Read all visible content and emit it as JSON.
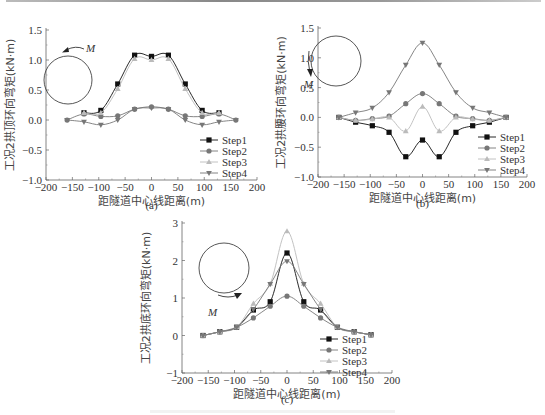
{
  "figure": {
    "panels": [
      "(a)",
      "(b)",
      "(c)"
    ]
  },
  "chart_data": [
    {
      "type": "line",
      "panel": "(a)",
      "title": "",
      "xlabel": "距隧道中心线距离(m)",
      "ylabel": "工况2拱顶环向弯矩(kN·m)",
      "xlim": [
        -200,
        200
      ],
      "ylim": [
        -1.0,
        1.5
      ],
      "xticks": [
        "-200",
        "-150",
        "-100",
        "-50",
        "0",
        "50",
        "100",
        "150",
        "200"
      ],
      "yticks": [
        "-1.0",
        "-0.5",
        "0.0",
        "0.5",
        "1.0",
        "1.5"
      ],
      "inset": {
        "shape": "circle",
        "moment_label": "M",
        "arrow_position": "top"
      },
      "legend_position": "lower right",
      "grid": false,
      "series": [
        {
          "name": "Step1",
          "marker": "square",
          "color": "#111111",
          "x": [
            -128,
            -96,
            -64,
            -32,
            0,
            32,
            64,
            96,
            128
          ],
          "values": [
            0.12,
            0.16,
            0.6,
            1.08,
            1.06,
            1.08,
            0.6,
            0.16,
            0.12
          ]
        },
        {
          "name": "Step2",
          "marker": "circle",
          "color": "#777777",
          "x": [
            -160,
            -128,
            -96,
            -64,
            -32,
            0,
            32,
            64,
            96,
            128,
            160
          ],
          "values": [
            0.0,
            0.1,
            0.06,
            0.07,
            0.18,
            0.22,
            0.18,
            0.07,
            0.06,
            0.1,
            0.0
          ]
        },
        {
          "name": "Step3",
          "marker": "triangle-up",
          "color": "#bbbbbb",
          "x": [
            -128,
            -96,
            -64,
            -32,
            0,
            32,
            64,
            96,
            128
          ],
          "values": [
            0.12,
            0.12,
            0.52,
            1.02,
            1.0,
            1.02,
            0.52,
            0.12,
            0.12
          ]
        },
        {
          "name": "Step4",
          "marker": "triangle-down",
          "color": "#777777",
          "x": [
            -160,
            -128,
            -96,
            -64,
            -32,
            0,
            32,
            64,
            96,
            128,
            160
          ],
          "values": [
            0.0,
            -0.03,
            -0.08,
            0.0,
            0.18,
            0.2,
            0.18,
            0.0,
            -0.08,
            -0.03,
            0.0
          ]
        }
      ]
    },
    {
      "type": "line",
      "panel": "(b)",
      "title": "",
      "xlabel": "距隧道中心线距离(m)",
      "ylabel": "工况2拱腰环向弯矩(kN·m)",
      "xlim": [
        -200,
        200
      ],
      "ylim": [
        -1.0,
        1.5
      ],
      "xticks": [
        "-200",
        "-150",
        "-100",
        "-50",
        "0",
        "50",
        "100",
        "150",
        "200"
      ],
      "yticks": [
        "-1.0",
        "-0.5",
        "0.0",
        "0.5",
        "1.0",
        "1.5"
      ],
      "inset": {
        "shape": "circle",
        "moment_label": "M",
        "arrow_position": "left"
      },
      "legend_position": "lower right",
      "grid": false,
      "series": [
        {
          "name": "Step1",
          "marker": "square",
          "color": "#111111",
          "x": [
            -160,
            -128,
            -96,
            -64,
            -32,
            0,
            32,
            64,
            96,
            128,
            160
          ],
          "values": [
            0.0,
            -0.08,
            -0.14,
            -0.25,
            -0.66,
            -0.38,
            -0.66,
            -0.25,
            -0.14,
            -0.08,
            0.0
          ]
        },
        {
          "name": "Step2",
          "marker": "circle",
          "color": "#777777",
          "x": [
            -160,
            -128,
            -96,
            -64,
            -32,
            0,
            32,
            64,
            96,
            128,
            160
          ],
          "values": [
            0.0,
            -0.05,
            -0.02,
            0.02,
            0.23,
            0.4,
            0.23,
            0.02,
            -0.02,
            -0.05,
            0.0
          ]
        },
        {
          "name": "Step3",
          "marker": "triangle-up",
          "color": "#bbbbbb",
          "x": [
            -160,
            -128,
            -96,
            -64,
            -32,
            0,
            32,
            64,
            96,
            128,
            160
          ],
          "values": [
            0.0,
            -0.05,
            -0.03,
            0.0,
            -0.23,
            0.18,
            -0.23,
            0.0,
            -0.03,
            -0.05,
            0.0
          ]
        },
        {
          "name": "Step4",
          "marker": "triangle-down",
          "color": "#777777",
          "x": [
            -160,
            -128,
            -96,
            -64,
            -32,
            0,
            32,
            64,
            96,
            128,
            160
          ],
          "values": [
            0.0,
            0.08,
            0.16,
            0.42,
            0.88,
            1.25,
            0.88,
            0.42,
            0.16,
            0.08,
            0.0
          ]
        }
      ]
    },
    {
      "type": "line",
      "panel": "(c)",
      "title": "",
      "xlabel": "距隧道中心线距离(m)",
      "ylabel": "工况2拱底环向弯矩(kN·m)",
      "xlim": [
        -200,
        200
      ],
      "ylim": [
        -1,
        3
      ],
      "xticks": [
        "-200",
        "-150",
        "-100",
        "-50",
        "0",
        "50",
        "100",
        "150",
        "200"
      ],
      "yticks": [
        "-1",
        "0",
        "1",
        "2",
        "3"
      ],
      "inset": {
        "shape": "circle",
        "moment_label": "M",
        "arrow_position": "bottom"
      },
      "legend_position": "lower right",
      "grid": false,
      "series": [
        {
          "name": "Step1",
          "marker": "square",
          "color": "#111111",
          "x": [
            -160,
            -128,
            -96,
            -64,
            -32,
            0,
            32,
            64,
            96,
            128,
            160
          ],
          "values": [
            0.0,
            0.1,
            0.22,
            0.68,
            0.9,
            2.2,
            0.9,
            0.68,
            0.22,
            0.1,
            0.02
          ]
        },
        {
          "name": "Step2",
          "marker": "circle",
          "color": "#777777",
          "x": [
            -160,
            -128,
            -96,
            -64,
            -32,
            0,
            32,
            64,
            96,
            128,
            160
          ],
          "values": [
            0.0,
            0.1,
            0.22,
            0.47,
            0.78,
            1.05,
            0.78,
            0.47,
            0.22,
            0.1,
            0.02
          ]
        },
        {
          "name": "Step3",
          "marker": "triangle-up",
          "color": "#bbbbbb",
          "x": [
            -160,
            -128,
            -96,
            -64,
            -32,
            0,
            32,
            64,
            96,
            128,
            160
          ],
          "values": [
            0.0,
            0.1,
            0.22,
            0.85,
            1.38,
            2.78,
            1.38,
            0.85,
            0.22,
            0.1,
            0.02
          ]
        },
        {
          "name": "Step4",
          "marker": "triangle-down",
          "color": "#777777",
          "x": [
            -160,
            -128,
            -96,
            -64,
            -32,
            0,
            32,
            64,
            96,
            128,
            160
          ],
          "values": [
            0.0,
            0.1,
            0.22,
            0.7,
            1.37,
            1.98,
            1.37,
            0.7,
            0.22,
            0.1,
            0.02
          ]
        }
      ]
    }
  ]
}
